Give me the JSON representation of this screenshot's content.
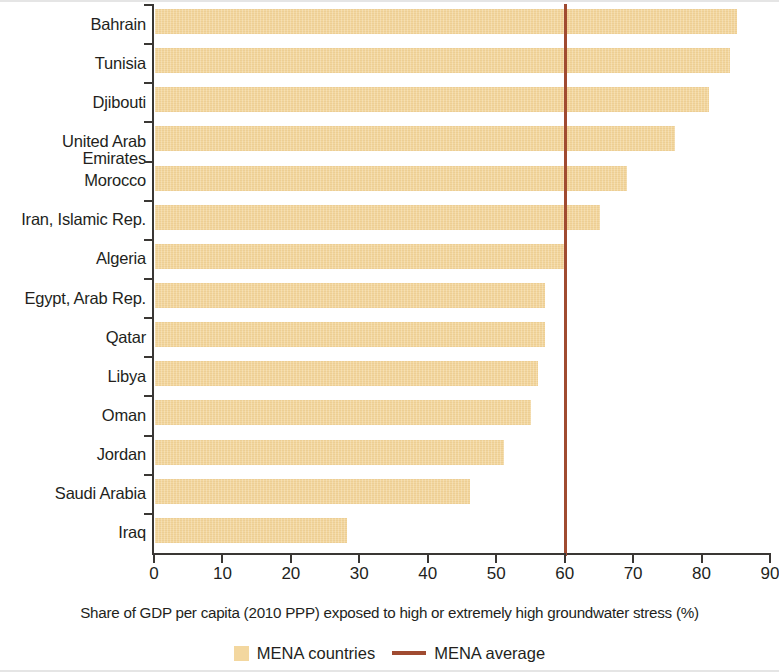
{
  "chart_data": {
    "type": "bar",
    "orientation": "horizontal",
    "title": "",
    "xlabel": "Share of GDP per capita (2010 PPP) exposed to  high or extremely high groundwater stress (%)",
    "ylabel": "",
    "xlim": [
      0,
      90
    ],
    "xticks": [
      0,
      10,
      20,
      30,
      40,
      50,
      60,
      70,
      80,
      90
    ],
    "xtick_labels": [
      "0",
      "10",
      "20",
      "30",
      "40",
      "50",
      "60",
      "70",
      "80",
      "90"
    ],
    "grid": false,
    "categories": [
      "Bahrain",
      "Tunisia",
      "Djibouti",
      "United Arab Emirates",
      "Morocco",
      "Iran, Islamic Rep.",
      "Algeria",
      "Egypt, Arab Rep.",
      "Qatar",
      "Libya",
      "Oman",
      "Jordan",
      "Saudi Arabia",
      "Iraq"
    ],
    "values": [
      85,
      84,
      81,
      76,
      69,
      65,
      60,
      57,
      57,
      56,
      55,
      51,
      46,
      28
    ],
    "series": [
      {
        "name": "MENA countries",
        "color": "#f3d79f",
        "values": [
          85,
          84,
          81,
          76,
          69,
          65,
          60,
          57,
          57,
          56,
          55,
          51,
          46,
          28
        ]
      }
    ],
    "reference_line": {
      "name": "MENA average",
      "value": 60,
      "color": "#a04b31",
      "orientation": "vertical"
    },
    "legend": {
      "position": "bottom",
      "entries": [
        {
          "label": "MENA countries",
          "marker": "box",
          "color": "#f3d79f"
        },
        {
          "label": "MENA average",
          "marker": "line",
          "color": "#a04b31"
        }
      ]
    },
    "colors": {
      "bar": "#f3d79f",
      "average_line": "#a04b31",
      "axis": "#3a3734",
      "text": "#231f1c"
    }
  }
}
